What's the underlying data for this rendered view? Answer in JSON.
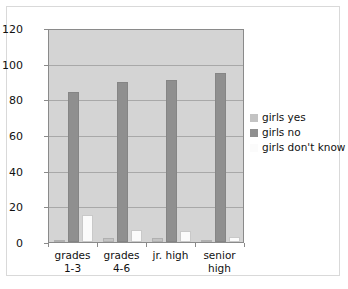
{
  "chart_data": {
    "type": "bar",
    "title": "",
    "xlabel": "",
    "ylabel": "",
    "ylim": [
      0,
      120
    ],
    "yticks": [
      0,
      20,
      40,
      60,
      80,
      100,
      120
    ],
    "grid": true,
    "legend_position": "right",
    "categories": [
      "grades\n1-3",
      "grades\n4-6",
      "jr. high",
      "senior\nhigh"
    ],
    "series": [
      {
        "name": "girls yes",
        "color": "#c3c3c3",
        "values": [
          1,
          2,
          2,
          1
        ]
      },
      {
        "name": "girls no",
        "color": "#8f8f8f",
        "values": [
          84,
          90,
          91,
          95
        ]
      },
      {
        "name": "girls don't know",
        "color": "#fbfbfb",
        "values": [
          15,
          7,
          6,
          3
        ]
      }
    ]
  },
  "plot": {
    "background_color": "#d4d4d4",
    "border_color": "#8a8a8a",
    "gridline_color": "#a8a8a8"
  },
  "frame": {
    "border_color": "#d9d9d9",
    "background_color": "#ffffff"
  }
}
